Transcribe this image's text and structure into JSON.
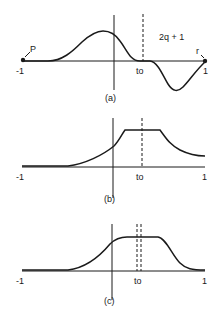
{
  "panels": [
    {
      "caption": "(a)",
      "x_left": "-1",
      "x_right": "1",
      "t0": "to",
      "expression": "2q + 1",
      "point_left": "P",
      "point_right": "r"
    },
    {
      "caption": "(b)",
      "x_left": "-1",
      "x_right": "1",
      "t0": "to"
    },
    {
      "caption": "(c)",
      "x_left": "-1",
      "x_right": "1",
      "t0": "to"
    }
  ],
  "colors": {
    "ink": "#1a1a1a",
    "background": "#ffffff"
  }
}
